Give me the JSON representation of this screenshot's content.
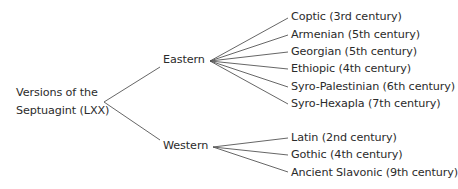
{
  "diagram": {
    "type": "tree",
    "root": {
      "label_line1": "Versions of the",
      "label_line2": "Septuagint (LXX)"
    },
    "branches": [
      {
        "label": "Eastern",
        "children": [
          "Coptic (3rd century)",
          "Armenian (5th century)",
          "Georgian (5th century)",
          "Ethiopic (4th century)",
          "Syro-Palestinian (6th century)",
          "Syro-Hexapla (7th century)"
        ]
      },
      {
        "label": "Western",
        "children": [
          "Latin (2nd century)",
          "Gothic (4th century)",
          "Ancient Slavonic (9th century)"
        ]
      }
    ],
    "colors": {
      "text": "#2b2b2b",
      "lines": "#555555",
      "background": "#ffffff"
    }
  }
}
